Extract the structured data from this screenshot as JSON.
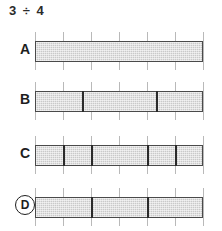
{
  "problem": {
    "expression": "3 ÷ 4",
    "dividend": 3,
    "divisor": 4,
    "operator": "÷"
  },
  "layout": {
    "bar_left_px": 35,
    "bar_width_px": 168,
    "row_tops_px": [
      30,
      80,
      134,
      186
    ],
    "tick_count": 7,
    "tick_color": "#b9b9b9",
    "bar_fill_color": "#c9c9c9",
    "bar_border_color": "#4a4a4a",
    "divider_color": "#2a2a2a",
    "text_color": "#1e1e1e"
  },
  "choices": [
    {
      "label": "A",
      "selected": false,
      "tick_fractions": [
        0,
        0.1667,
        0.3333,
        0.5,
        0.6667,
        0.8333,
        1
      ],
      "divider_fractions": [],
      "segment_count": 1,
      "description": "whole bar with six light tick guides and no dark partitions"
    },
    {
      "label": "B",
      "selected": false,
      "tick_fractions": [
        0,
        0.1667,
        0.3333,
        0.5,
        0.6667,
        0.8333,
        1
      ],
      "divider_fractions": [
        0.28,
        0.72
      ],
      "segment_count": 3,
      "description": "bar split into three parts by two dark partitions"
    },
    {
      "label": "C",
      "selected": false,
      "tick_fractions": [
        0,
        0.1667,
        0.3333,
        0.5,
        0.6667,
        0.8333,
        1
      ],
      "divider_fractions": [
        0.1667,
        0.3333,
        0.6667,
        0.8333
      ],
      "segment_count": 5,
      "description": "bar split into five parts by four dark partitions"
    },
    {
      "label": "D",
      "selected": true,
      "tick_fractions": [
        0,
        0.1667,
        0.3333,
        0.5,
        0.6667,
        0.8333,
        1
      ],
      "divider_fractions": [
        0.3333,
        0.6667
      ],
      "segment_count": 3,
      "description": "bar split into three equal parts; this choice is circled"
    }
  ]
}
